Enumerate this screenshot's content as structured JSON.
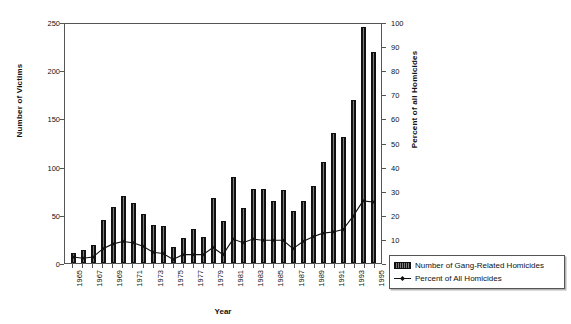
{
  "chart_data": {
    "type": "bar",
    "title": "",
    "xlabel": "Year",
    "ylabel": "Number of Victims",
    "ylabel_secondary": "Percent of all Homicides",
    "ylim": [
      0,
      250
    ],
    "ylim_secondary": [
      0,
      100
    ],
    "ytick_labels": [
      "250",
      "200",
      "150",
      "100",
      "50",
      "0"
    ],
    "ytick_values": [
      250,
      200,
      150,
      100,
      50,
      0
    ],
    "ytick_labels_secondary": [
      "100",
      "90",
      "80",
      "70",
      "60",
      "50",
      "40",
      "30",
      "20",
      "10",
      "0"
    ],
    "ytick_values_secondary": [
      100,
      90,
      80,
      70,
      60,
      50,
      40,
      30,
      20,
      10,
      0
    ],
    "grid": false,
    "legend_position": "right-outside",
    "categories": [
      "1965",
      "1966",
      "1967",
      "1968",
      "1969",
      "1970",
      "1971",
      "1972",
      "1973",
      "1974",
      "1975",
      "1976",
      "1977",
      "1978",
      "1979",
      "1980",
      "1981",
      "1982",
      "1983",
      "1984",
      "1985",
      "1986",
      "1987",
      "1988",
      "1989",
      "1990",
      "1991",
      "1992",
      "1993",
      "1994",
      "1995"
    ],
    "xtick_labels_shown": [
      "1965",
      "1967",
      "1969",
      "1971",
      "1973",
      "1975",
      "1977",
      "1979",
      "1981",
      "1983",
      "1985",
      "1987",
      "1989",
      "1991",
      "1993",
      "1995"
    ],
    "series": [
      {
        "name": "Number of Gang-Related Homicides",
        "kind": "bar",
        "axis": "left",
        "values": [
          10,
          14,
          19,
          45,
          58,
          70,
          62,
          51,
          39,
          38,
          17,
          26,
          35,
          27,
          67,
          44,
          89,
          57,
          77,
          77,
          64,
          76,
          54,
          64,
          80,
          105,
          135,
          131,
          169,
          245,
          219
        ]
      },
      {
        "name": "Percent of All Homicides",
        "kind": "line",
        "axis": "right",
        "values": [
          2.5,
          2.0,
          2.5,
          6.0,
          8.0,
          9.0,
          8.5,
          7.0,
          4.5,
          4.0,
          1.5,
          3.5,
          3.5,
          3.5,
          6.5,
          3.5,
          10.0,
          8.5,
          10.0,
          9.5,
          9.5,
          9.5,
          6.0,
          9.0,
          11.0,
          12.5,
          13.0,
          14.0,
          19.5,
          26.0,
          25.5
        ]
      }
    ]
  },
  "legend": {
    "items": [
      {
        "label": "Number of Gang-Related Homicides",
        "marker": "bar-swatch"
      },
      {
        "label": "Percent of All Homicides",
        "marker": "line-diamond-marker"
      }
    ]
  }
}
